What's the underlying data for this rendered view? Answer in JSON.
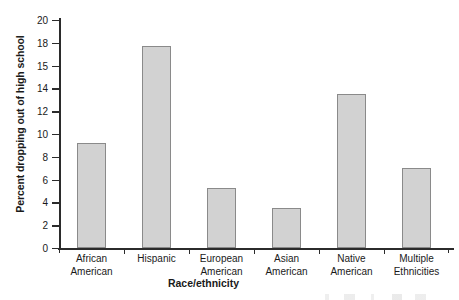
{
  "chart_data": {
    "type": "bar",
    "title": "",
    "xlabel": "Race/ethnicity",
    "ylabel": "Percent dropping out of high school",
    "categories": [
      "African American",
      "Hispanic",
      "European American",
      "Asian American",
      "Native American",
      "Multiple Ethnicities"
    ],
    "category_lines": [
      [
        "African",
        "American"
      ],
      [
        "Hispanic",
        ""
      ],
      [
        "European",
        "American"
      ],
      [
        "Asian",
        "American"
      ],
      [
        "Native",
        "American"
      ],
      [
        "Multiple",
        "Ethnicities"
      ]
    ],
    "values": [
      9.2,
      17.7,
      5.3,
      3.5,
      13.5,
      7.0
    ],
    "ylim": [
      0,
      20
    ],
    "yticks": [
      0,
      2,
      4,
      6,
      8,
      10,
      12,
      14,
      15,
      18,
      20
    ],
    "ytick_labels": [
      "0",
      "2",
      "4",
      "6",
      "8",
      "10",
      "12",
      "14",
      "15",
      "18",
      "20"
    ],
    "grid": false,
    "legend": false,
    "bar_fill": "#d2d2d2",
    "bar_edge": "#8a8a8a",
    "axis_color": "#2b2b2b"
  }
}
